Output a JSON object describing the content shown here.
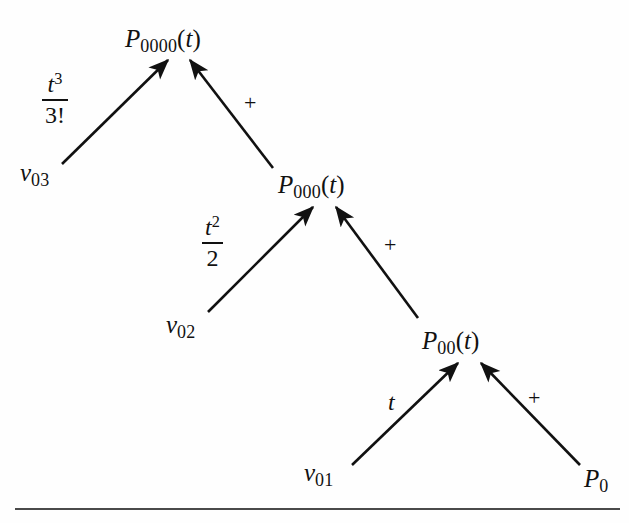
{
  "figure": {
    "type": "recursive-derivation-tree",
    "background_color": "#fefefe",
    "ink_color": "#111111",
    "rule_color": "#4a4a4a"
  },
  "nodes": [
    {
      "id": "p0000",
      "base": "P",
      "sub": "0000",
      "arg": "(t)",
      "x": 125,
      "y": 26
    },
    {
      "id": "p000",
      "base": "P",
      "sub": "000",
      "arg": "(t)",
      "x": 278,
      "y": 172
    },
    {
      "id": "p00",
      "base": "P",
      "sub": "00",
      "arg": "(t)",
      "x": 422,
      "y": 328
    },
    {
      "id": "p0",
      "base": "P",
      "sub": "0",
      "arg": "",
      "x": 584,
      "y": 466
    }
  ],
  "leaves": [
    {
      "id": "v03",
      "base": "v",
      "sub": "03",
      "x": 20,
      "y": 160
    },
    {
      "id": "v02",
      "base": "v",
      "sub": "02",
      "x": 166,
      "y": 312
    },
    {
      "id": "v01",
      "base": "v",
      "sub": "01",
      "x": 304,
      "y": 460
    }
  ],
  "edge_labels": [
    {
      "id": "coef-t3-3fact",
      "kind": "fraction",
      "numerator": "t",
      "numerator_exponent": "3",
      "denominator": "3!",
      "text": "t^3/3!",
      "x": 42,
      "y": 70
    },
    {
      "id": "coef-t2-2",
      "kind": "fraction",
      "numerator": "t",
      "numerator_exponent": "2",
      "denominator": "2",
      "text": "t^2/2",
      "x": 202,
      "y": 213
    },
    {
      "id": "coef-t",
      "kind": "symbol",
      "text": "t",
      "x": 388,
      "y": 390
    }
  ],
  "operators": [
    {
      "id": "plus-top",
      "text": "+",
      "x": 244,
      "y": 92
    },
    {
      "id": "plus-middle",
      "text": "+",
      "x": 384,
      "y": 234
    },
    {
      "id": "plus-bottom",
      "text": "+",
      "x": 528,
      "y": 387
    }
  ],
  "arrows": [
    {
      "id": "arrow-v03-to-p0000",
      "from": "v03",
      "to": "p0000",
      "x1": 62,
      "y1": 164,
      "x2": 168,
      "y2": 60
    },
    {
      "id": "arrow-p000-to-p0000",
      "from": "p000",
      "to": "p0000",
      "x1": 273,
      "y1": 168,
      "x2": 190,
      "y2": 60
    },
    {
      "id": "arrow-v02-to-p000",
      "from": "v02",
      "to": "p000",
      "x1": 208,
      "y1": 312,
      "x2": 313,
      "y2": 207
    },
    {
      "id": "arrow-p00-to-p000",
      "from": "p00",
      "to": "p000",
      "x1": 418,
      "y1": 318,
      "x2": 336,
      "y2": 207
    },
    {
      "id": "arrow-v01-to-p00",
      "from": "v01",
      "to": "p00",
      "x1": 352,
      "y1": 465,
      "x2": 458,
      "y2": 363
    },
    {
      "id": "arrow-p0-to-p00",
      "from": "p0",
      "to": "p00",
      "x1": 580,
      "y1": 465,
      "x2": 481,
      "y2": 363
    }
  ],
  "rule": {
    "id": "bottom-rule",
    "x": 15,
    "y": 508,
    "width": 605,
    "height": 2
  }
}
